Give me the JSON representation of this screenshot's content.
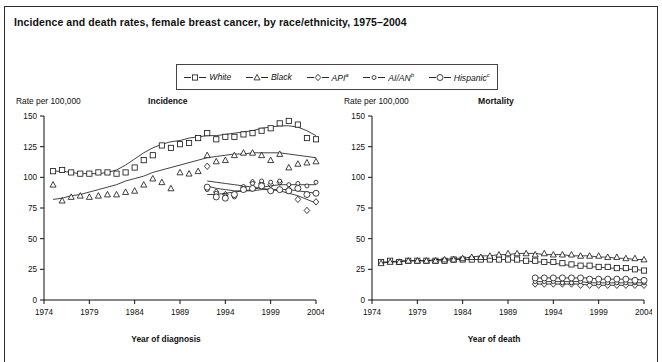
{
  "title": "Incidence and death rates, female breast cancer, by race/ethnicity, 1975–2004",
  "legend": {
    "items": [
      {
        "label": "White",
        "marker": "square",
        "sup": ""
      },
      {
        "label": "Black",
        "marker": "triangle",
        "sup": ""
      },
      {
        "label": "API",
        "marker": "diamond",
        "sup": "a"
      },
      {
        "label": "AI/AN",
        "marker": "small-circle",
        "sup": "b"
      },
      {
        "label": "Hispanic",
        "marker": "circle",
        "sup": "c"
      }
    ]
  },
  "panels": {
    "left": {
      "name": "Incidence",
      "ylabel": "Rate per 100,000",
      "xlabel": "Year of diagnosis"
    },
    "right": {
      "name": "Mortality",
      "ylabel": "Rate per 100,000",
      "xlabel": "Year of death"
    }
  },
  "chart_data": [
    {
      "type": "line",
      "title": "Incidence",
      "xlabel": "Year of diagnosis",
      "ylabel": "Rate per 100,000",
      "xlim": [
        1974,
        2004
      ],
      "ylim": [
        0,
        150
      ],
      "xticks": [
        1974,
        1979,
        1984,
        1989,
        1994,
        1999,
        2004
      ],
      "yticks": [
        0,
        25,
        50,
        75,
        100,
        125,
        150
      ],
      "grid": false,
      "legend_position": "top-center",
      "series": [
        {
          "name": "White",
          "marker": "square",
          "x": [
            1975,
            1976,
            1977,
            1978,
            1979,
            1980,
            1981,
            1982,
            1983,
            1984,
            1985,
            1986,
            1987,
            1988,
            1989,
            1990,
            1991,
            1992,
            1993,
            1994,
            1995,
            1996,
            1997,
            1998,
            1999,
            2000,
            2001,
            2002,
            2003,
            2004
          ],
          "values": [
            105,
            106,
            104,
            103,
            103,
            104,
            104,
            103,
            104,
            108,
            114,
            118,
            126,
            124,
            127,
            128,
            132,
            136,
            131,
            133,
            133,
            135,
            136,
            138,
            140,
            144,
            146,
            143,
            132,
            131
          ],
          "trend": [
            105,
            105,
            104,
            103,
            103,
            103,
            104,
            106,
            110,
            115,
            120,
            124,
            127,
            129,
            130,
            132,
            133,
            134,
            134,
            135,
            136,
            137,
            138,
            140,
            141,
            142,
            142,
            141,
            138,
            134
          ]
        },
        {
          "name": "Black",
          "marker": "triangle",
          "x": [
            1975,
            1976,
            1977,
            1978,
            1979,
            1980,
            1981,
            1982,
            1983,
            1984,
            1985,
            1986,
            1987,
            1988,
            1989,
            1990,
            1991,
            1992,
            1993,
            1994,
            1995,
            1996,
            1997,
            1998,
            1999,
            2000,
            2001,
            2002,
            2003,
            2004
          ],
          "values": [
            94,
            81,
            84,
            85,
            84,
            85,
            86,
            86,
            88,
            89,
            94,
            99,
            96,
            91,
            104,
            103,
            105,
            118,
            113,
            114,
            118,
            120,
            120,
            118,
            114,
            119,
            108,
            111,
            112,
            113
          ],
          "trend": [
            82,
            83,
            85,
            86,
            88,
            90,
            92,
            94,
            97,
            99,
            101,
            104,
            106,
            108,
            110,
            112,
            114,
            116,
            117,
            118,
            119,
            119,
            120,
            120,
            120,
            120,
            119,
            118,
            117,
            116
          ]
        },
        {
          "name": "API",
          "marker": "diamond",
          "x": [
            1992,
            1993,
            1994,
            1995,
            1996,
            1997,
            1998,
            1999,
            2000,
            2001,
            2002,
            2003,
            2004
          ],
          "values": [
            109,
            88,
            86,
            85,
            92,
            96,
            95,
            94,
            96,
            90,
            82,
            73,
            80
          ],
          "trend": [
            97,
            96,
            95,
            94,
            93,
            92,
            91,
            90,
            89,
            87,
            85,
            82,
            79
          ]
        },
        {
          "name": "AI/AN",
          "marker": "small-circle",
          "x": [
            1992,
            1993,
            1994,
            1995,
            1996,
            1997,
            1998,
            1999,
            2000,
            2001,
            2002,
            2003,
            2004
          ],
          "values": [
            90,
            87,
            85,
            84,
            91,
            95,
            97,
            96,
            97,
            94,
            95,
            93,
            96
          ],
          "trend": [
            86,
            86,
            87,
            88,
            89,
            90,
            92,
            93,
            94,
            94,
            94,
            94,
            94
          ]
        },
        {
          "name": "Hispanic",
          "marker": "circle",
          "x": [
            1992,
            1993,
            1994,
            1995,
            1996,
            1997,
            1998,
            1999,
            2000,
            2001,
            2002,
            2003,
            2004
          ],
          "values": [
            92,
            84,
            83,
            86,
            90,
            91,
            93,
            89,
            90,
            89,
            91,
            86,
            87
          ],
          "trend": [
            93,
            91,
            90,
            89,
            89,
            89,
            90,
            90,
            90,
            90,
            89,
            88,
            87
          ]
        }
      ]
    },
    {
      "type": "line",
      "title": "Mortality",
      "xlabel": "Year of death",
      "ylabel": "Rate per 100,000",
      "xlim": [
        1974,
        2004
      ],
      "ylim": [
        0,
        150
      ],
      "xticks": [
        1974,
        1979,
        1984,
        1989,
        1994,
        1999,
        2004
      ],
      "yticks": [
        0,
        25,
        50,
        75,
        100,
        125,
        150
      ],
      "grid": false,
      "legend_position": "top-center",
      "series": [
        {
          "name": "White",
          "marker": "square",
          "x": [
            1975,
            1976,
            1977,
            1978,
            1979,
            1980,
            1981,
            1982,
            1983,
            1984,
            1985,
            1986,
            1987,
            1988,
            1989,
            1990,
            1991,
            1992,
            1993,
            1994,
            1995,
            1996,
            1997,
            1998,
            1999,
            2000,
            2001,
            2002,
            2003,
            2004
          ],
          "values": [
            31,
            32,
            31,
            32,
            32,
            32,
            32,
            32,
            33,
            33,
            33,
            33,
            33,
            33,
            33,
            33,
            32,
            32,
            31,
            31,
            30,
            29,
            28,
            28,
            27,
            27,
            26,
            26,
            25,
            24
          ],
          "trend": [
            31,
            31,
            32,
            32,
            32,
            32,
            32,
            32,
            33,
            33,
            33,
            33,
            33,
            33,
            33,
            32,
            32,
            31,
            31,
            30,
            29,
            28,
            28,
            27,
            27,
            26,
            26,
            25,
            25,
            24
          ]
        },
        {
          "name": "Black",
          "marker": "triangle",
          "x": [
            1975,
            1976,
            1977,
            1978,
            1979,
            1980,
            1981,
            1982,
            1983,
            1984,
            1985,
            1986,
            1987,
            1988,
            1989,
            1990,
            1991,
            1992,
            1993,
            1994,
            1995,
            1996,
            1997,
            1998,
            1999,
            2000,
            2001,
            2002,
            2003,
            2004
          ],
          "values": [
            30,
            31,
            31,
            32,
            32,
            32,
            32,
            33,
            33,
            34,
            35,
            35,
            36,
            37,
            38,
            38,
            38,
            37,
            38,
            37,
            37,
            37,
            36,
            36,
            36,
            35,
            35,
            34,
            34,
            33
          ],
          "trend": [
            30,
            31,
            31,
            32,
            32,
            32,
            33,
            33,
            34,
            34,
            35,
            36,
            36,
            37,
            37,
            38,
            38,
            38,
            37,
            37,
            37,
            36,
            36,
            36,
            35,
            35,
            34,
            34,
            33,
            33
          ]
        },
        {
          "name": "API",
          "marker": "diamond",
          "x": [
            1992,
            1993,
            1994,
            1995,
            1996,
            1997,
            1998,
            1999,
            2000,
            2001,
            2002,
            2003,
            2004
          ],
          "values": [
            13,
            13,
            13,
            13,
            13,
            12,
            12,
            12,
            12,
            12,
            12,
            12,
            12
          ],
          "trend": [
            13,
            13,
            13,
            13,
            13,
            13,
            12,
            12,
            12,
            12,
            12,
            12,
            12
          ]
        },
        {
          "name": "AI/AN",
          "marker": "small-circle",
          "x": [
            1992,
            1993,
            1994,
            1995,
            1996,
            1997,
            1998,
            1999,
            2000,
            2001,
            2002,
            2003,
            2004
          ],
          "values": [
            15,
            15,
            15,
            14,
            14,
            15,
            15,
            14,
            14,
            14,
            14,
            14,
            14
          ],
          "trend": [
            15,
            15,
            15,
            15,
            15,
            15,
            14,
            14,
            14,
            14,
            14,
            14,
            14
          ]
        },
        {
          "name": "Hispanic",
          "marker": "circle",
          "x": [
            1992,
            1993,
            1994,
            1995,
            1996,
            1997,
            1998,
            1999,
            2000,
            2001,
            2002,
            2003,
            2004
          ],
          "values": [
            18,
            18,
            18,
            18,
            18,
            18,
            17,
            17,
            17,
            17,
            17,
            16,
            16
          ],
          "trend": [
            18,
            18,
            18,
            18,
            18,
            18,
            18,
            17,
            17,
            17,
            17,
            17,
            16
          ]
        }
      ]
    }
  ]
}
